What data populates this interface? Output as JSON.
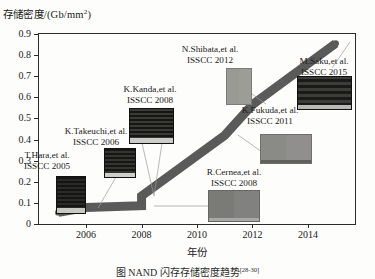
{
  "chart_data": {
    "type": "line",
    "title": "",
    "ylabel": "存储密度/(Gb/mm²)",
    "xlabel": "年份",
    "xlim": [
      2004.3,
      2015.7
    ],
    "ylim": [
      0,
      0.9
    ],
    "grid": false,
    "legend": "none",
    "y_ticks": [
      "0",
      "0.1",
      "0.2",
      "0.3",
      "0.4",
      "0.5",
      "0.6",
      "0.7",
      "0.8",
      "0.9"
    ],
    "y_tick_values": [
      0,
      0.1,
      0.2,
      0.3,
      0.4,
      0.5,
      0.6,
      0.7,
      0.8,
      0.9
    ],
    "x_ticks": [
      "2006",
      "2008",
      "2010",
      "2012",
      "2014"
    ],
    "x_tick_values": [
      2006,
      2008,
      2010,
      2012,
      2014
    ],
    "series": [
      {
        "name": "存储密度",
        "x": [
          2005,
          2006,
          2008,
          2008,
          2011,
          2012,
          2015
        ],
        "values": [
          0.055,
          0.078,
          0.087,
          0.133,
          0.42,
          0.565,
          0.855
        ],
        "color": "#5a5a5a",
        "marker": "circle"
      }
    ],
    "annotations": [
      {
        "name": "T.Hara",
        "author": "T.Hara,et al.",
        "conference": "ISSCC 2005",
        "x": 2005,
        "y": 0.055
      },
      {
        "name": "K.Takeuchi",
        "author": "K.Takeuchi,et al.",
        "conference": "ISSCC 2006",
        "x": 2006,
        "y": 0.078
      },
      {
        "name": "R.Cernea",
        "author": "R.Cernea,et al.",
        "conference": "ISSCC 2008",
        "x": 2008,
        "y": 0.087
      },
      {
        "name": "K.Kanda",
        "author": "K.Kanda,et al.",
        "conference": "ISSCC 2008",
        "x": 2008,
        "y": 0.133
      },
      {
        "name": "K.Fukuda",
        "author": "K.Fukuda,et al.",
        "conference": "ISSCC 2011",
        "x": 2011,
        "y": 0.42
      },
      {
        "name": "N.Shibata",
        "author": "N.Shibata,et al.",
        "conference": "ISSCC 2012",
        "x": 2012,
        "y": 0.565
      },
      {
        "name": "M.Saku",
        "author": "M.Saku,et al.",
        "conference": "ISSCC 2015",
        "x": 2015,
        "y": 0.855
      }
    ]
  },
  "caption": {
    "text": "图          NAND 闪存存储密度趋势",
    "ref": "[28-30]"
  },
  "colors": {
    "line": "#5a5a5a",
    "axis": "#2b2b2b",
    "leader": "#8d8d8d",
    "background": "#fdfdfb"
  }
}
